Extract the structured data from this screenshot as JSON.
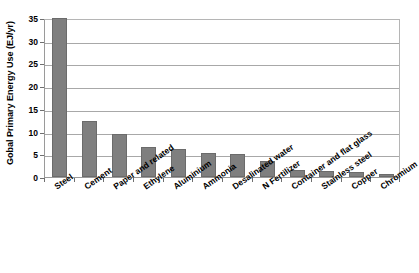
{
  "chart_data": {
    "type": "bar",
    "title": "",
    "subtitle": "",
    "xlabel": "",
    "ylabel": "Gobal Primary Energy Use (EJ/yr)",
    "ylim": [
      0,
      35
    ],
    "yticks": [
      0,
      5,
      10,
      15,
      20,
      25,
      30,
      35
    ],
    "ytick_labels": [
      "0",
      "5",
      "10",
      "15",
      "20",
      "25",
      "30",
      "35"
    ],
    "grid": "horizontal",
    "legend": "none",
    "bar_color": "#7f7f7f",
    "bar_edge_color": "#6b6b6b",
    "plot_border_color": "#9a9a9a",
    "gridline_color": "#a8a8a8",
    "categories": [
      "Steel",
      "Cement",
      "Paper and related",
      "Ethylene",
      "Aluminium",
      "Ammonia",
      "Desalinated water",
      "N Fertilizer",
      "Container and flat glass",
      "Stainless steel",
      "Copper",
      "Chromium"
    ],
    "values": [
      35.0,
      12.4,
      9.4,
      6.6,
      6.1,
      5.3,
      5.0,
      3.6,
      1.5,
      1.4,
      1.0,
      0.6
    ]
  }
}
